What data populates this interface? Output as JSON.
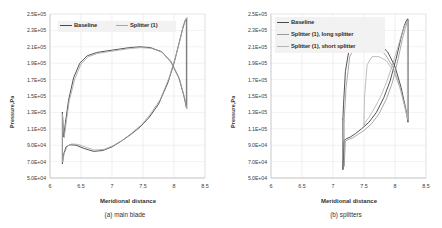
{
  "figure": {
    "panels": [
      {
        "id": "a",
        "caption": "(a) main blade",
        "xlabel": "Meridional distance",
        "ylabel": "Pressure,Pa",
        "legend": [
          {
            "label": "Baseline",
            "color": "#4a4a4a"
          },
          {
            "label": "Splitter (1)",
            "color": "#a8a8a8"
          }
        ]
      },
      {
        "id": "b",
        "caption": "(b) splitters",
        "xlabel": "Meridional distance",
        "ylabel": "Pressure,Pa",
        "legend": [
          {
            "label": "Baseline",
            "color": "#4a4a4a"
          },
          {
            "label": "Splitter (1), long splitter",
            "color": "#9a9a9a"
          },
          {
            "label": "Splitter (1), short splitter",
            "color": "#b4b4b4"
          }
        ]
      }
    ]
  },
  "chart_data": [
    {
      "type": "line",
      "panel": "a",
      "title": "(a) main blade",
      "xlabel": "Meridional distance",
      "ylabel": "Pressure,Pa",
      "xlim": [
        6,
        8.5
      ],
      "ylim": [
        50000,
        250000
      ],
      "xticks": [
        "6",
        "6.5",
        "7",
        "7.5",
        "8",
        "8.5"
      ],
      "xtick_values": [
        6,
        6.5,
        7,
        7.5,
        8,
        8.5
      ],
      "yticks": [
        "5.0E+04",
        "7.0E+04",
        "9.0E+04",
        "1.1E+05",
        "1.3E+05",
        "1.5E+05",
        "1.7E+05",
        "1.9E+05",
        "2.1E+05",
        "2.3E+05",
        "2.5E+05"
      ],
      "ytick_values": [
        50000,
        70000,
        90000,
        110000,
        130000,
        150000,
        170000,
        190000,
        210000,
        230000,
        250000
      ],
      "grid": true,
      "legend_position": "top-center",
      "series": [
        {
          "name": "Baseline",
          "color": "#4a4a4a",
          "comment": "closed blade-loading loop: leading-edge vertical segment at x=6.2, suction side lower branch, pressure side upper branch, trailing edge at x=8.2",
          "x": [
            6.2,
            6.2,
            6.2,
            6.22,
            6.26,
            6.32,
            6.42,
            6.55,
            6.7,
            6.85,
            7.0,
            7.15,
            7.3,
            7.45,
            7.6,
            7.75,
            7.9,
            8.0,
            8.08,
            8.14,
            8.18,
            8.2,
            8.2,
            8.16,
            8.08,
            7.95,
            7.8,
            7.62,
            7.45,
            7.28,
            7.1,
            6.92,
            6.75,
            6.6,
            6.48,
            6.38,
            6.3,
            6.25,
            6.22,
            6.2
          ],
          "y": [
            130000,
            105000,
            67000,
            79000,
            88000,
            90500,
            90000,
            86000,
            82500,
            83500,
            88000,
            95000,
            103000,
            112000,
            124000,
            140000,
            166000,
            190000,
            214000,
            232000,
            242000,
            244000,
            136000,
            150000,
            172000,
            192000,
            204000,
            209000,
            210000,
            209000,
            207000,
            205000,
            203000,
            199000,
            190000,
            172000,
            145000,
            118000,
            100000,
            130000
          ]
        },
        {
          "name": "Splitter (1)",
          "color": "#a8a8a8",
          "comment": "nearly overlapping baseline, slightly higher on pressure side mid-chord",
          "x": [
            6.2,
            6.2,
            6.2,
            6.23,
            6.28,
            6.35,
            6.45,
            6.58,
            6.72,
            6.88,
            7.02,
            7.18,
            7.32,
            7.48,
            7.62,
            7.78,
            7.92,
            8.02,
            8.1,
            8.15,
            8.19,
            8.21,
            8.21,
            8.17,
            8.09,
            7.96,
            7.82,
            7.64,
            7.47,
            7.3,
            7.12,
            6.94,
            6.77,
            6.62,
            6.5,
            6.4,
            6.31,
            6.26,
            6.23,
            6.2
          ],
          "y": [
            128000,
            104000,
            69000,
            80000,
            89000,
            91500,
            91000,
            87500,
            84000,
            85000,
            89500,
            96500,
            105000,
            115000,
            128000,
            146000,
            172000,
            196000,
            219000,
            236000,
            244000,
            246000,
            134000,
            148000,
            170000,
            190000,
            203000,
            208000,
            209000,
            208000,
            206000,
            204000,
            202000,
            198000,
            189000,
            171000,
            144000,
            117000,
            99000,
            128000
          ]
        }
      ]
    },
    {
      "type": "line",
      "panel": "b",
      "title": "(b) splitters",
      "xlabel": "Meridional distance",
      "ylabel": "Pressure,Pa",
      "xlim": [
        6,
        8.5
      ],
      "ylim": [
        50000,
        250000
      ],
      "xticks": [
        "6",
        "6.5",
        "7",
        "7.5",
        "8",
        "8.5"
      ],
      "xtick_values": [
        6,
        6.5,
        7,
        7.5,
        8,
        8.5
      ],
      "yticks": [
        "5.0E+04",
        "7.0E+04",
        "9.0E+04",
        "1.1E+05",
        "1.3E+05",
        "1.5E+05",
        "1.7E+05",
        "1.9E+05",
        "2.1E+05",
        "2.3E+05",
        "2.5E+05"
      ],
      "ytick_values": [
        50000,
        70000,
        90000,
        110000,
        130000,
        150000,
        170000,
        190000,
        210000,
        230000,
        250000
      ],
      "grid": true,
      "legend_position": "top-left",
      "series": [
        {
          "name": "Baseline",
          "color": "#4a4a4a",
          "comment": "long splitter loop starting x=7.15 with deep leading-edge spike to 6.0E+04",
          "x": [
            7.16,
            7.16,
            7.16,
            7.18,
            7.22,
            7.28,
            7.36,
            7.46,
            7.58,
            7.7,
            7.82,
            7.92,
            8.02,
            8.1,
            8.15,
            8.19,
            8.21,
            8.21,
            8.18,
            8.1,
            8.0,
            7.88,
            7.74,
            7.6,
            7.46,
            7.34,
            7.26,
            7.2,
            7.17,
            7.16
          ],
          "y": [
            122000,
            95000,
            60000,
            96000,
            98000,
            100000,
            104000,
            110000,
            118000,
            130000,
            148000,
            168000,
            196000,
            222000,
            236000,
            243000,
            244000,
            118000,
            132000,
            160000,
            186000,
            204000,
            214000,
            218000,
            219000,
            216000,
            207000,
            180000,
            140000,
            122000
          ]
        },
        {
          "name": "Splitter (1), long splitter",
          "color": "#9a9a9a",
          "comment": "starts slightly later, loop closes near x=8.2",
          "x": [
            7.18,
            7.18,
            7.18,
            7.2,
            7.25,
            7.32,
            7.4,
            7.5,
            7.62,
            7.74,
            7.86,
            7.96,
            8.05,
            8.12,
            8.17,
            8.2,
            8.21,
            8.21,
            8.17,
            8.08,
            7.97,
            7.84,
            7.7,
            7.57,
            7.45,
            7.35,
            7.27,
            7.21,
            7.18
          ],
          "y": [
            120000,
            98000,
            64000,
            95000,
            97000,
            99000,
            103000,
            108000,
            116000,
            128000,
            146000,
            167000,
            195000,
            220000,
            234000,
            241000,
            242000,
            120000,
            134000,
            161000,
            185000,
            201000,
            210000,
            213000,
            213000,
            209000,
            198000,
            160000,
            120000
          ]
        },
        {
          "name": "Splitter (1), short splitter",
          "color": "#b4b4b4",
          "comment": "short splitter begins near x=7.5 at 1.2E+05 and rises to trailing edge",
          "x": [
            7.5,
            7.5,
            7.52,
            7.58,
            7.66,
            7.76,
            7.86,
            7.95,
            8.04,
            8.11,
            8.16,
            8.19,
            8.2,
            8.2,
            8.16,
            8.08,
            7.98,
            7.86,
            7.74,
            7.63,
            7.55,
            7.51,
            7.5
          ],
          "y": [
            124000,
            113000,
            118000,
            124000,
            134000,
            148000,
            166000,
            186000,
            208000,
            226000,
            236000,
            240000,
            241000,
            122000,
            136000,
            160000,
            180000,
            193000,
            198000,
            198000,
            188000,
            150000,
            124000
          ]
        }
      ]
    }
  ]
}
